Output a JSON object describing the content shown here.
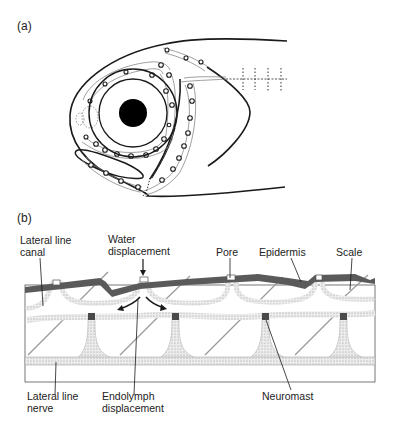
{
  "panels": {
    "a": {
      "label": "(a)",
      "subject": "fish head lateral line system"
    },
    "b": {
      "label": "(b)",
      "annotations": {
        "lateral_line_canal": "Lateral line\ncanal",
        "water_displacement": "Water\ndisplacement",
        "pore": "Pore",
        "epidermis": "Epidermis",
        "scale": "Scale",
        "lateral_line_nerve": "Lateral line\nnerve",
        "endolymph_displacement": "Endolymph\ndisplacement",
        "neuromast": "Neuromast"
      }
    }
  },
  "colors": {
    "line": "#1a1a1a",
    "epidermis": "#5a5a5a",
    "canal_fill": "#e6e6e6",
    "nerve_fill": "#d9d9d9",
    "neuromast": "#4a4a4a",
    "scale_line": "#9a9a9a"
  }
}
